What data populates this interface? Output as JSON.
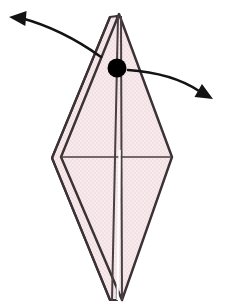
{
  "figure": {
    "background_color": "#ffffff"
  },
  "colors": {
    "paper_fill": "#f2e0e3",
    "paper_fill_shade": "#efdadd",
    "paper_fill_light": "#f6eaec",
    "outline": "#3b3236",
    "crease": "#4a3f44",
    "arrow": "#131313",
    "pivot_dot": "#000000"
  },
  "geometry": {
    "canvas": {
      "width": 232,
      "height": 304
    },
    "main_diamond": {
      "top": [
        119,
        14
      ],
      "left": [
        61,
        157
      ],
      "bottom": [
        122,
        300
      ],
      "right": [
        172,
        157
      ]
    },
    "under_layer": {
      "top": [
        110,
        17
      ],
      "left": [
        52,
        158
      ],
      "bottom": [
        110,
        300
      ]
    },
    "center_crease": {
      "x1": 118,
      "y1": 16,
      "x2": 112,
      "y2": 300
    },
    "center_crease_2": {
      "x1": 121,
      "y1": 16,
      "x2": 122,
      "y2": 300
    },
    "horizontal_crease": {
      "x1": 61,
      "y1": 157,
      "x2": 172,
      "y2": 157
    }
  },
  "elements": {
    "pivot_dot": {
      "name": "pivot point",
      "cx": 117,
      "cy": 68,
      "r": 9.5
    },
    "arrow_left": {
      "name": "left swing arrow",
      "direction": "up-left",
      "start": [
        101,
        57
      ],
      "control": [
        62,
        29
      ],
      "end": [
        21,
        18
      ],
      "head_tip": [
        9,
        17
      ],
      "head_length": 17,
      "head_width": 15
    },
    "arrow_right": {
      "name": "right swing arrow",
      "direction": "down-right",
      "start": [
        128,
        70
      ],
      "control": [
        172,
        73
      ],
      "end": [
        199,
        91
      ],
      "head_tip": [
        213,
        99
      ],
      "head_length": 17,
      "head_width": 15
    }
  },
  "labels": {
    "figure_caption": "",
    "step_number": ""
  }
}
